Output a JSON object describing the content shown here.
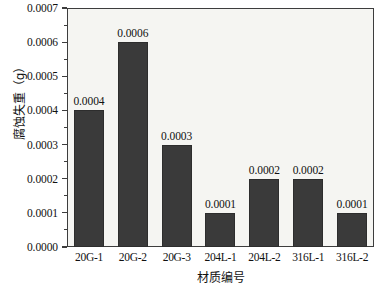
{
  "chart_data": {
    "type": "bar",
    "title": "",
    "subtitle": "",
    "xlabel": "材质编号",
    "ylabel": "腐蚀失重（g）",
    "categories": [
      "20G-1",
      "20G-2",
      "20G-3",
      "204L-1",
      "204L-2",
      "316L-1",
      "316L-2"
    ],
    "values": [
      0.0004,
      0.0006,
      0.0003,
      0.0001,
      0.0002,
      0.0002,
      0.0001
    ],
    "value_labels": [
      "0.0004",
      "0.0006",
      "0.0003",
      "0.0001",
      "0.0002",
      "0.0002",
      "0.0001"
    ],
    "ylim": [
      0.0,
      0.0007
    ],
    "ytick_labels": [
      "0.0000",
      "0.0001",
      "0.0002",
      "0.0003",
      "0.0004",
      "0.0005",
      "0.0006",
      "0.0007"
    ],
    "ytick_values": [
      0.0,
      0.0001,
      0.0002,
      0.0003,
      0.0004,
      0.0005,
      0.0006,
      0.0007
    ],
    "yminor_values": [
      5e-05,
      0.00015,
      0.00025,
      0.00035,
      0.00045,
      0.00055,
      0.00065
    ],
    "grid": false,
    "legend": false,
    "legend_position": "none",
    "bar_color": "#3a3a3a",
    "plot_background": "#f5f5f2",
    "axis_color": "#3d3d3d",
    "figure_background": "#ffffff"
  }
}
